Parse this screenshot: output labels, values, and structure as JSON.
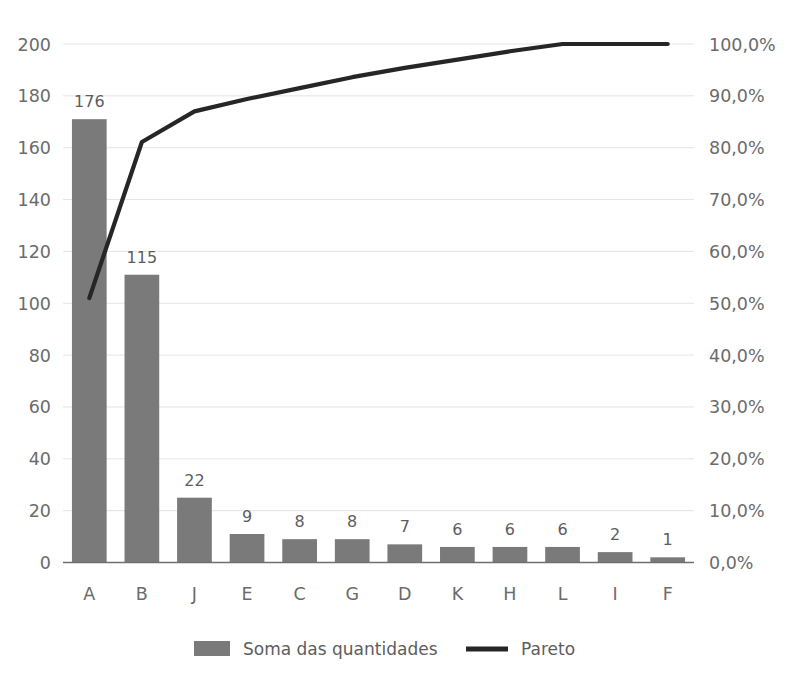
{
  "chart_data": {
    "type": "bar",
    "title": "",
    "xlabel": "",
    "ylabel": "",
    "categories": [
      "A",
      "B",
      "J",
      "E",
      "C",
      "G",
      "D",
      "K",
      "H",
      "L",
      "I",
      "F"
    ],
    "series": [
      {
        "name": "Soma das quantidades",
        "kind": "bar",
        "axis": "left",
        "values": [
          176,
          115,
          22,
          9,
          8,
          8,
          7,
          6,
          6,
          6,
          2,
          1
        ],
        "drawn_heights": [
          171,
          111,
          25,
          11,
          9,
          9,
          7,
          6,
          6,
          6,
          4,
          2
        ],
        "color": "#7a7a7a"
      },
      {
        "name": "Pareto",
        "kind": "line",
        "axis": "right",
        "values": [
          51.0,
          81.1,
          87.0,
          89.4,
          91.5,
          93.6,
          95.4,
          97.0,
          98.6,
          100.0,
          100.0,
          100.0
        ],
        "color": "#262626"
      }
    ],
    "y_left": {
      "ticks": [
        "0",
        "20",
        "40",
        "60",
        "80",
        "100",
        "120",
        "140",
        "160",
        "180",
        "200"
      ],
      "min": 0,
      "max": 200,
      "step": 20
    },
    "y_right": {
      "ticks": [
        "0,0%",
        "10,0%",
        "20,0%",
        "30,0%",
        "40,0%",
        "50,0%",
        "60,0%",
        "70,0%",
        "80,0%",
        "90,0%",
        "100,0%"
      ],
      "min": 0,
      "max": 100,
      "step": 10,
      "suffix": "%",
      "decimal_separator": ","
    },
    "grid": true,
    "legend_position": "bottom",
    "legend": [
      {
        "label": "Soma das quantidades",
        "marker": "swatch",
        "color": "#7a7a7a"
      },
      {
        "label": "Pareto",
        "marker": "line",
        "color": "#262626"
      }
    ],
    "bar_value_labels": [
      "176",
      "115",
      "22",
      "9",
      "8",
      "8",
      "7",
      "6",
      "6",
      "6",
      "2",
      "1"
    ]
  },
  "colors": {
    "background": "#ffffff",
    "bar": "#7a7a7a",
    "line": "#262626",
    "grid": "#e4e4e4",
    "axis": "#6f6f6f",
    "tick_text": "#6b6b6b",
    "label_text": "#5d5d5d"
  },
  "cropped_title_remnant": ""
}
